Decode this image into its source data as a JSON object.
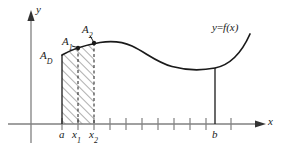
{
  "figure": {
    "colors": {
      "axis": "#808080",
      "curve": "#1a1a1a",
      "hatch": "#4d4d4d",
      "label": "#1a1a1a",
      "background": "#ffffff"
    },
    "axes": {
      "x_axis_label": "x",
      "y_axis_label": "y",
      "x_axis_y_px": 124,
      "y_axis_x_px": 31,
      "tick_spacing_px": 16,
      "tick_count": 11,
      "first_tick_px": 62
    },
    "curve": {
      "label_prefix": "y",
      "label_equals": "=",
      "label_fn": "f",
      "label_arg": "(x)",
      "label_full": "y=f(x)",
      "start_x_px": 62,
      "start_y_px": 55,
      "peak_x_px": 120,
      "peak_y_px": 43,
      "min_x_px": 215,
      "min_y_px": 68,
      "end_x_px": 250,
      "end_y_px": 34
    },
    "regions": {
      "area_labels": [
        {
          "name": "A_D",
          "base": "A",
          "sub": "D"
        },
        {
          "name": "A_1",
          "base": "A",
          "sub": "1"
        },
        {
          "name": "A_2",
          "base": "A",
          "sub": "2"
        }
      ],
      "hatched_from_px": 62,
      "hatched_to_px": 94
    },
    "x_marks": [
      {
        "name": "a",
        "base": "a",
        "sub": "",
        "x_px": 62
      },
      {
        "name": "x1",
        "base": "x",
        "sub": "1",
        "x_px": 78
      },
      {
        "name": "x2",
        "base": "x",
        "sub": "2",
        "x_px": 94
      },
      {
        "name": "b",
        "base": "b",
        "sub": "",
        "x_px": 215
      }
    ],
    "points": [
      {
        "name": "point-x1",
        "x_px": 78,
        "y_px": 48
      },
      {
        "name": "point-x2",
        "x_px": 94,
        "y_px": 43
      }
    ]
  }
}
